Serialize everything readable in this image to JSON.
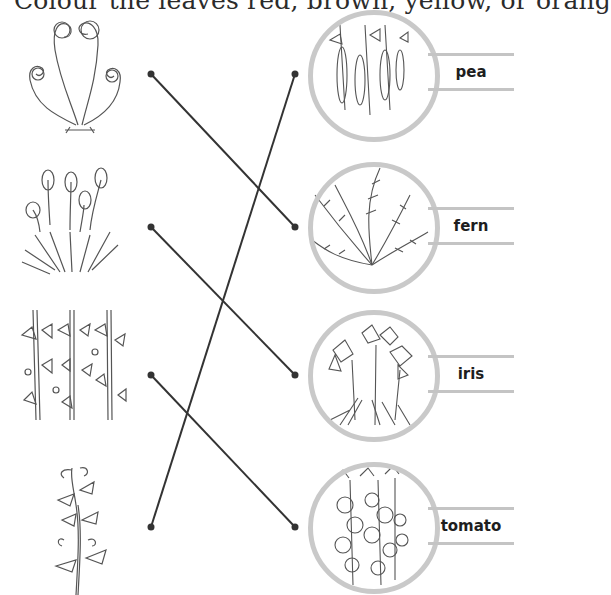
{
  "heading": "Colour the leaves red, brown, yellow, or orang",
  "left_plants": [
    {
      "name": "fern-fiddleheads",
      "dot": {
        "x": 151,
        "y": 74
      }
    },
    {
      "name": "iris-buds",
      "dot": {
        "x": 151,
        "y": 227
      }
    },
    {
      "name": "tomato-vines",
      "dot": {
        "x": 151,
        "y": 375
      }
    },
    {
      "name": "pea-vine",
      "dot": {
        "x": 151,
        "y": 527
      }
    }
  ],
  "right_plants": [
    {
      "label": "pea",
      "dot": {
        "x": 295,
        "y": 74
      }
    },
    {
      "label": "fern",
      "dot": {
        "x": 295,
        "y": 227
      }
    },
    {
      "label": "iris",
      "dot": {
        "x": 295,
        "y": 375
      }
    },
    {
      "label": "tomato",
      "dot": {
        "x": 295,
        "y": 527
      }
    }
  ],
  "matches": [
    {
      "from": 0,
      "to": 1
    },
    {
      "from": 1,
      "to": 2
    },
    {
      "from": 2,
      "to": 3
    },
    {
      "from": 3,
      "to": 0
    }
  ],
  "colors": {
    "line": "#333333",
    "ring": "#c9c9c9",
    "label_rule": "#c4c4c4",
    "ink": "#444444"
  }
}
